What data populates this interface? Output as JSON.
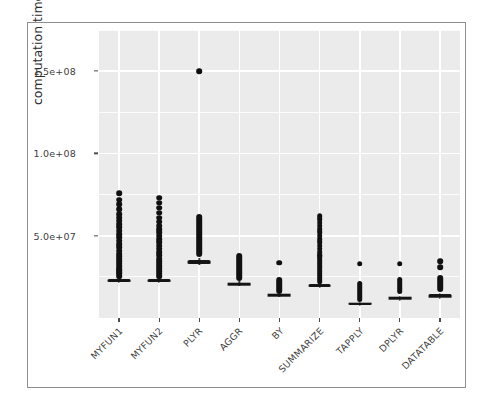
{
  "chart_data": {
    "type": "box",
    "title": "",
    "xlabel": "",
    "ylabel": "computation time",
    "ylim": [
      0,
      175000000
    ],
    "grid": true,
    "legend": "none",
    "y_ticks": [
      {
        "value": 50000000,
        "label": "5.0e+07"
      },
      {
        "value": 100000000,
        "label": "1.0e+08"
      },
      {
        "value": 150000000,
        "label": "1.5e+08"
      }
    ],
    "categories": [
      "MYFUN1",
      "MYFUN2",
      "PLYR",
      "AGGR",
      "BY",
      "SUMMARIZE",
      "TAPPLY",
      "DPLYR",
      "DATATABLE"
    ],
    "boxes": [
      {
        "category": "MYFUN1",
        "q1": 22000000,
        "median": 22600000,
        "q3": 23400000,
        "whisker_low": 21000000,
        "whisker_high": 24500000,
        "outliers": [
          25500000,
          27000000,
          28000000,
          29000000,
          30000000,
          31500000,
          33000000,
          34500000,
          36000000,
          37500000,
          39000000,
          41000000,
          43000000,
          45000000,
          47000000,
          49000000,
          51000000,
          53000000,
          55000000,
          57000000,
          59000000,
          61000000,
          63000000,
          66000000,
          69000000,
          72000000,
          76000000
        ]
      },
      {
        "category": "MYFUN2",
        "q1": 22000000,
        "median": 22600000,
        "q3": 23400000,
        "whisker_low": 21000000,
        "whisker_high": 24500000,
        "outliers": [
          25500000,
          27000000,
          28500000,
          30000000,
          31500000,
          33000000,
          34500000,
          36000000,
          38000000,
          40000000,
          42000000,
          44000000,
          46000000,
          48000000,
          50000000,
          52000000,
          54000000,
          56000000,
          58500000,
          61000000,
          64000000,
          67000000,
          70000000,
          73000000
        ]
      },
      {
        "category": "PLYR",
        "q1": 33000000,
        "median": 34000000,
        "q3": 35500000,
        "whisker_low": 32000000,
        "whisker_high": 36500000,
        "outliers": [
          38000000,
          40000000,
          42000000,
          44000000,
          46000000,
          48000000,
          50000000,
          52000000,
          54000000,
          56000000,
          58000000,
          60000000,
          62000000,
          150000000
        ]
      },
      {
        "category": "AGGR",
        "q1": 20000000,
        "median": 20700000,
        "q3": 21500000,
        "whisker_low": 19200000,
        "whisker_high": 22200000,
        "outliers": [
          23500000,
          24500000,
          25500000,
          26500000,
          27500000,
          28500000,
          29500000,
          30500000,
          32000000,
          34000000,
          36000000,
          38000000
        ]
      },
      {
        "category": "BY",
        "q1": 13500000,
        "median": 14000000,
        "q3": 14600000,
        "whisker_low": 13000000,
        "whisker_high": 15200000,
        "outliers": [
          16000000,
          17000000,
          18000000,
          19000000,
          20000000,
          21000000,
          22000000,
          23000000,
          24000000,
          33500000
        ]
      },
      {
        "category": "SUMMARIZE",
        "q1": 19000000,
        "median": 19700000,
        "q3": 20500000,
        "whisker_low": 18300000,
        "whisker_high": 21300000,
        "outliers": [
          22500000,
          24000000,
          25500000,
          27000000,
          28500000,
          30000000,
          31500000,
          33000000,
          34500000,
          36000000,
          38000000,
          40000000,
          42000000,
          44000000,
          46000000,
          48000000,
          50000000,
          52000000,
          54000000,
          56000000,
          58000000,
          60000000,
          62000000,
          37500000
        ]
      },
      {
        "category": "TAPPLY",
        "q1": 8200000,
        "median": 8700000,
        "q3": 9300000,
        "whisker_low": 7800000,
        "whisker_high": 9900000,
        "outliers": [
          11000000,
          12000000,
          13000000,
          14000000,
          15000000,
          16000000,
          17000000,
          18000000,
          19000000,
          20000000,
          21000000,
          33000000
        ]
      },
      {
        "category": "DPLYR",
        "q1": 11600000,
        "median": 12100000,
        "q3": 13000000,
        "whisker_low": 10500000,
        "whisker_high": 13600000,
        "outliers": [
          16000000,
          17000000,
          18000000,
          19000000,
          20000000,
          21000000,
          22000000,
          23000000,
          24000000,
          33000000
        ]
      },
      {
        "category": "DATATABLE",
        "q1": 13000000,
        "median": 13400000,
        "q3": 14400000,
        "whisker_low": 11500000,
        "whisker_high": 15000000,
        "outliers": [
          17000000,
          18000000,
          19000000,
          20000000,
          21000000,
          22000000,
          23000000,
          24000000,
          25000000,
          34500000,
          31000000
        ]
      }
    ],
    "colors": {
      "panel": "#ebebeb",
      "grid": "#ffffff",
      "box_line": "#1c1c1c",
      "box_fill": "#d9d9d9",
      "outlier": "#101010",
      "text": "#3d3d3d",
      "frame": "#8e8e8e"
    }
  }
}
